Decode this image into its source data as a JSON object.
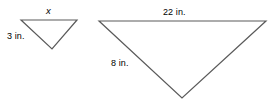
{
  "figure": {
    "background_color": "#ffffff",
    "stroke_color": "#5a5a5a",
    "text_color": "#000000",
    "width": 271,
    "height": 104
  },
  "shapes": {
    "small_triangle": {
      "name": "small-triangle",
      "orientation": "inverted",
      "vertices": [
        [
          21,
          20
        ],
        [
          77,
          20
        ],
        [
          52,
          49
        ]
      ],
      "top_label": "x",
      "left_side_label": "3 in."
    },
    "large_triangle": {
      "name": "large-triangle",
      "orientation": "inverted",
      "vertices": [
        [
          99,
          21
        ],
        [
          266,
          21
        ],
        [
          182,
          98
        ]
      ],
      "top_label": "22 in.",
      "left_side_label": "8 in."
    }
  },
  "labels": {
    "small_top": "x",
    "small_left": "3 in.",
    "large_top": "22 in.",
    "large_left": "8 in."
  }
}
